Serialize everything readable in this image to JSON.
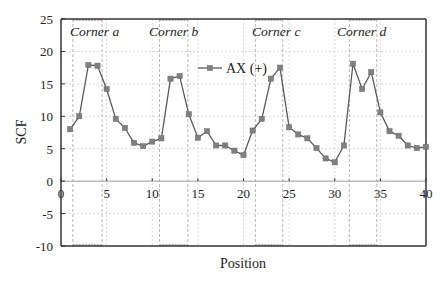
{
  "chart_data": {
    "type": "line",
    "title": "",
    "xlabel": "Position",
    "ylabel": "SCF",
    "xlim": [
      0,
      40
    ],
    "ylim": [
      -10,
      25
    ],
    "xticks": [
      0,
      5,
      10,
      15,
      20,
      25,
      30,
      35,
      40
    ],
    "yticks": [
      -10,
      -5,
      0,
      5,
      10,
      15,
      20,
      25
    ],
    "grid": true,
    "legend_position": "upper center",
    "series": [
      {
        "name": "AX (+)",
        "marker": "square",
        "color": "#5a5a5a",
        "x": [
          1,
          2,
          3,
          4,
          5,
          6,
          7,
          8,
          9,
          10,
          11,
          12,
          13,
          14,
          15,
          16,
          17,
          18,
          19,
          20,
          21,
          22,
          23,
          24,
          25,
          26,
          27,
          28,
          29,
          30,
          31,
          32,
          33,
          34,
          35,
          36,
          37,
          38,
          39,
          40
        ],
        "values": [
          8.0,
          10.0,
          17.9,
          17.8,
          14.2,
          9.6,
          8.2,
          5.9,
          5.4,
          6.1,
          6.6,
          15.8,
          16.2,
          10.3,
          6.7,
          7.7,
          5.5,
          5.5,
          4.7,
          4.0,
          7.8,
          9.6,
          15.8,
          17.5,
          8.3,
          7.2,
          6.6,
          5.1,
          3.5,
          2.9,
          5.5,
          18.1,
          14.2,
          16.8,
          10.6,
          7.7,
          7.0,
          5.5,
          5.1,
          5.3
        ]
      }
    ],
    "annotations": [
      {
        "label": "Corner a",
        "region": [
          1.3,
          4.5
        ]
      },
      {
        "label": "Corner b",
        "region": [
          10.8,
          13.9
        ]
      },
      {
        "label": "Corner c",
        "region": [
          21.3,
          24.3
        ]
      },
      {
        "label": "Corner d",
        "region": [
          31.6,
          34.6
        ]
      }
    ]
  },
  "colors": {
    "axis": "#333333",
    "grid": "#d9d9d9",
    "corner_line": "#b8b8b8",
    "series": "#5a5a5a",
    "marker": "#808080"
  }
}
